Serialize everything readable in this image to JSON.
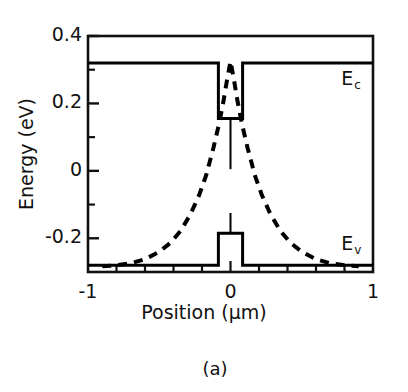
{
  "figure": {
    "caption": "(a)",
    "xlabel": "Position (µm)",
    "ylabel": "Energy (eV)"
  },
  "axes": {
    "x_ticks": [
      "-1",
      "0",
      "1"
    ],
    "y_ticks": [
      "0.4",
      "0.2",
      "0",
      "-0.2"
    ]
  },
  "labels": {
    "conduction": "E",
    "conduction_sub": "c",
    "valence": "E",
    "valence_sub": "v"
  },
  "chart_data": {
    "type": "line",
    "title": "",
    "xlabel": "Position (µm)",
    "ylabel": "Energy (eV)",
    "xlim": [
      -1,
      1
    ],
    "ylim": [
      -0.3,
      0.4
    ],
    "xtick_values": [
      -1,
      0,
      1
    ],
    "xtick_labels": [
      "-1",
      "0",
      "1"
    ],
    "xminor_step": 0.2,
    "ytick_values": [
      0.4,
      0.2,
      0,
      -0.2
    ],
    "ytick_labels": [
      "0.4",
      "0.2",
      "0",
      "-0.2"
    ],
    "yminor_values": [
      0.3,
      0.1,
      -0.1
    ],
    "grid": false,
    "legend": "inline-annotations",
    "annotations": [
      {
        "text": "Ec",
        "x": 0.82,
        "y": 0.27,
        "meaning": "conduction band edge"
      },
      {
        "text": "Ev",
        "x": 0.82,
        "y": -0.22,
        "meaning": "valence band edge"
      }
    ],
    "series": [
      {
        "name": "Ec",
        "style": "solid",
        "color": "#000000",
        "width": 3,
        "description": "Conduction band edge: flat barrier at 0.32 eV, square quantum well dropping to 0.155 eV for |x| < 0.085 um",
        "x": [
          -1.0,
          -0.085,
          -0.085,
          0.085,
          0.085,
          1.0
        ],
        "y": [
          0.32,
          0.32,
          0.155,
          0.155,
          0.32,
          0.32
        ]
      },
      {
        "name": "Ev",
        "style": "solid",
        "color": "#000000",
        "width": 3,
        "description": "Valence band edge: flat barrier at -0.28 eV, square well rising to -0.185 eV for |x| < 0.085 um",
        "x": [
          -1.0,
          -0.085,
          -0.085,
          0.085,
          0.085,
          1.0
        ],
        "y": [
          -0.28,
          -0.28,
          -0.185,
          -0.185,
          -0.28,
          -0.28
        ]
      },
      {
        "name": "carrier-distribution",
        "style": "dashed",
        "color": "#000000",
        "width": 4,
        "description": "Dashed peaked distribution centered at x=0, peak 0.325 eV, exponential-like tails decaying to the valence baseline near |x| = 0.9 um",
        "x": [
          -0.9,
          -0.8,
          -0.7,
          -0.6,
          -0.5,
          -0.42,
          -0.35,
          -0.28,
          -0.22,
          -0.17,
          -0.12,
          -0.08,
          -0.05,
          -0.025,
          0.0,
          0.025,
          0.05,
          0.08,
          0.12,
          0.17,
          0.22,
          0.28,
          0.35,
          0.42,
          0.5,
          0.6,
          0.7,
          0.8,
          0.9
        ],
        "y": [
          -0.283,
          -0.28,
          -0.274,
          -0.262,
          -0.24,
          -0.213,
          -0.178,
          -0.128,
          -0.072,
          -0.012,
          0.068,
          0.14,
          0.205,
          0.268,
          0.325,
          0.268,
          0.205,
          0.14,
          0.068,
          -0.012,
          -0.072,
          -0.128,
          -0.178,
          -0.213,
          -0.24,
          -0.262,
          -0.274,
          -0.28,
          -0.283
        ]
      },
      {
        "name": "well-vertical-marker-upper",
        "style": "solid",
        "color": "#000000",
        "width": 2,
        "description": "Thin vertical line at x=0 from 0.155 eV down to 0.005 eV",
        "x": [
          0.0,
          0.0
        ],
        "y": [
          0.155,
          0.005
        ]
      },
      {
        "name": "well-vertical-marker-lower",
        "style": "solid",
        "color": "#000000",
        "width": 2,
        "description": "Thin vertical line at x=0 from -0.185 eV up to -0.125 eV",
        "x": [
          0.0,
          0.0
        ],
        "y": [
          -0.185,
          -0.125
        ]
      }
    ]
  }
}
